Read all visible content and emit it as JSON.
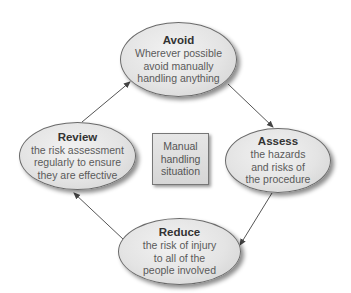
{
  "diagram": {
    "type": "cycle",
    "center": {
      "label": "Manual handling situation",
      "lines": [
        "Manual",
        "handling",
        "situation"
      ]
    },
    "nodes": [
      {
        "id": "avoid",
        "title": "Avoid",
        "lines": [
          "Wherever possible",
          "avoid manually",
          "handling anything"
        ]
      },
      {
        "id": "assess",
        "title": "Assess",
        "lines": [
          "the hazards",
          "and risks of",
          "the procedure"
        ]
      },
      {
        "id": "reduce",
        "title": "Reduce",
        "lines": [
          "the risk of injury",
          "to all of the",
          "people involved"
        ]
      },
      {
        "id": "review",
        "title": "Review",
        "lines": [
          "the risk assessment",
          "regularly to ensure",
          "they are effective"
        ]
      }
    ],
    "edges": [
      {
        "from": "avoid",
        "to": "assess"
      },
      {
        "from": "assess",
        "to": "reduce"
      },
      {
        "from": "reduce",
        "to": "review"
      },
      {
        "from": "review",
        "to": "avoid"
      }
    ],
    "colors": {
      "node_fill": "#e4e4e4",
      "node_border": "#6a6a6a",
      "title_text": "#333333",
      "body_text": "#5a5a5a",
      "arrow": "#555555"
    }
  }
}
